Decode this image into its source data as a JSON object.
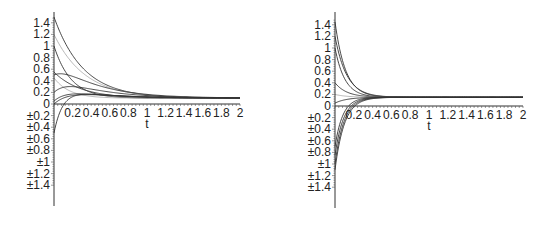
{
  "chart_data": [
    {
      "type": "line",
      "title": "",
      "xlabel": "t",
      "ylabel": "",
      "xlim": [
        0,
        2
      ],
      "ylim": [
        -1.4,
        1.5
      ],
      "grid": false,
      "legend": null,
      "x_ticks": [
        "0.2",
        "0.4",
        "0.6",
        "0.8",
        "1",
        "1.2",
        "1.4",
        "1.6",
        "1.8",
        "2"
      ],
      "y_ticks": [
        "1.4",
        "1.2",
        "1",
        "0.8",
        "0.6",
        "0.4",
        "0.2",
        "0",
        "±0.2",
        "±0.4",
        "±0.6",
        "±0.8",
        "±1",
        "±1.2",
        "±1.4"
      ],
      "layout": {
        "originX": 54,
        "originY": 104,
        "xScale": 93,
        "yScale": 58,
        "axisTop": 12,
        "axisBottom": 206
      },
      "equilibrium": 0.1,
      "series": [
        {
          "name": "s1",
          "y0": 1.5,
          "rate": 3.2,
          "hump": 0,
          "style": "dark"
        },
        {
          "name": "s2",
          "y0": 1.0,
          "rate": 5.5,
          "hump": 0,
          "style": "dark"
        },
        {
          "name": "s3",
          "y0": 1.2,
          "rate": 3.0,
          "hump": 0,
          "style": "light"
        },
        {
          "name": "s4",
          "y0": 0.5,
          "rate": 4.5,
          "hump": 0.35,
          "style": "dark"
        },
        {
          "name": "s5",
          "y0": 0.55,
          "rate": 3.5,
          "hump": 0,
          "style": "dark"
        },
        {
          "name": "s6",
          "y0": 0.45,
          "rate": 6.0,
          "hump": 0,
          "style": "light"
        },
        {
          "name": "s7",
          "y0": 0.2,
          "rate": 5.0,
          "hump": 0.25,
          "style": "dark"
        },
        {
          "name": "s8",
          "y0": 0.05,
          "rate": 6.0,
          "hump": 0.12,
          "style": "dark"
        },
        {
          "name": "s9",
          "y0": 0.0,
          "rate": 4.5,
          "hump": 0.14,
          "style": "dark"
        },
        {
          "name": "s10",
          "y0": -0.5,
          "rate": 10.0,
          "hump": 0.12,
          "style": "dark"
        }
      ]
    },
    {
      "type": "line",
      "title": "",
      "xlabel": "t",
      "ylabel": "",
      "xlim": [
        0,
        2
      ],
      "ylim": [
        -1.4,
        1.5
      ],
      "grid": false,
      "legend": null,
      "x_ticks": [
        "0.2",
        "0.4",
        "0.6",
        "0.8",
        "1",
        "1.2",
        "1.4",
        "1.6",
        "1.8",
        "2"
      ],
      "y_ticks": [
        "1.4",
        "1.2",
        "1",
        "0.8",
        "0.6",
        "0.4",
        "0.2",
        "0",
        "±0.2",
        "±0.4",
        "±0.6",
        "±0.8",
        "±1",
        "±1.2",
        "±1.4"
      ],
      "layout": {
        "originX": 335,
        "originY": 106,
        "xScale": 94,
        "yScale": 58,
        "axisTop": 12,
        "axisBottom": 208
      },
      "equilibrium": 0.15,
      "series": [
        {
          "name": "s1",
          "y0": 1.45,
          "rate": 9.0,
          "hump": 0,
          "style": "dark"
        },
        {
          "name": "s2",
          "y0": 1.2,
          "rate": 8.0,
          "hump": 0,
          "style": "dark"
        },
        {
          "name": "s3",
          "y0": 1.0,
          "rate": 9.5,
          "hump": 0,
          "style": "dark"
        },
        {
          "name": "s4",
          "y0": 0.4,
          "rate": 8.0,
          "hump": 0,
          "style": "dark"
        },
        {
          "name": "s5",
          "y0": 0.2,
          "rate": 8.0,
          "hump": 0,
          "style": "light"
        },
        {
          "name": "s6",
          "y0": 0.05,
          "rate": 8.0,
          "hump": 0,
          "style": "dark"
        },
        {
          "name": "s7",
          "y0": -0.7,
          "rate": 12.0,
          "hump": 0,
          "style": "dark"
        },
        {
          "name": "s8",
          "y0": -0.85,
          "rate": 11.0,
          "hump": 0,
          "style": "dark"
        },
        {
          "name": "s9",
          "y0": -1.0,
          "rate": 10.5,
          "hump": 0,
          "style": "dark"
        },
        {
          "name": "s10",
          "y0": -1.1,
          "rate": 10.0,
          "hump": 0,
          "style": "dark"
        }
      ]
    }
  ]
}
